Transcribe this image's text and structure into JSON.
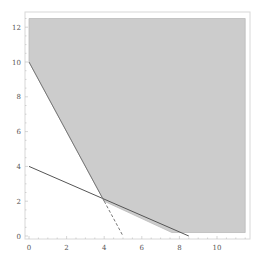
{
  "chart_data": {
    "type": "area",
    "title": "",
    "xlabel": "",
    "ylabel": "",
    "xlim": [
      -0.2,
      11.8
    ],
    "ylim": [
      -0.2,
      12.8
    ],
    "grid": false,
    "x_ticks": [
      "0",
      "2",
      "4",
      "6",
      "8",
      "10"
    ],
    "y_ticks": [
      "0",
      "2",
      "4",
      "6",
      "8",
      "10",
      "12"
    ],
    "feasible_region": {
      "fill": "#cccccc",
      "vertices": [
        [
          0,
          12.5
        ],
        [
          0,
          10
        ],
        [
          4,
          2
        ],
        [
          7.6,
          0.2
        ],
        [
          11.5,
          0.2
        ],
        [
          11.5,
          12.5
        ]
      ]
    },
    "lines": [
      {
        "name": "solid-constraint",
        "style": "solid",
        "points": [
          [
            0,
            4
          ],
          [
            8.5,
            0
          ]
        ],
        "color": "#555555"
      },
      {
        "name": "steep-constraint",
        "style": "solid",
        "points": [
          [
            0,
            10
          ],
          [
            4,
            2
          ]
        ],
        "color": "#777777"
      },
      {
        "name": "dashed-extension",
        "style": "dashed",
        "points": [
          [
            4,
            2
          ],
          [
            5,
            0
          ]
        ],
        "color": "#777777"
      }
    ],
    "colors": {
      "region": "#cccccc",
      "frame": "#d8d8d8",
      "line": "#555555"
    }
  }
}
